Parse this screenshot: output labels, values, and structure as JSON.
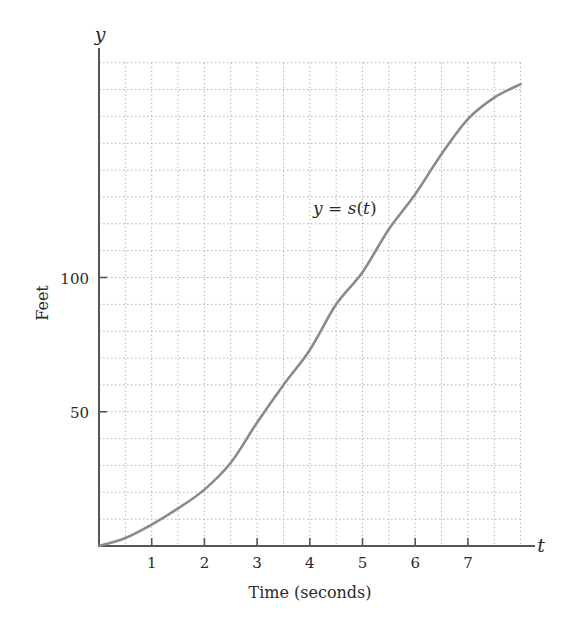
{
  "chart_data": {
    "type": "line",
    "title": "",
    "xlabel": "Time (seconds)",
    "ylabel": "Feet",
    "x_axis_var": "t",
    "y_axis_var": "y",
    "xlim": [
      0,
      8
    ],
    "ylim": [
      0,
      180
    ],
    "x_ticks": [
      1,
      2,
      3,
      4,
      5,
      6,
      7
    ],
    "x_tick_labels": [
      "1",
      "2",
      "3",
      "4",
      "5",
      "6",
      "7"
    ],
    "y_ticks": [
      50,
      100
    ],
    "y_tick_labels": [
      "50",
      "100"
    ],
    "grid": true,
    "grid_x_step": 0.5,
    "grid_y_step": 10,
    "grid_style": "dotted",
    "legend": null,
    "annotations": [
      {
        "text": "y = s(t)",
        "x": 5.1,
        "y": 125
      }
    ],
    "series": [
      {
        "name": "y = s(t)",
        "color": "#8a8a8a",
        "x": [
          0,
          0.5,
          1,
          1.5,
          2,
          2.5,
          3,
          3.5,
          4,
          4.5,
          5,
          5.5,
          6,
          6.5,
          7,
          7.5,
          8
        ],
        "values": [
          0,
          3,
          8,
          14,
          21,
          31,
          46,
          60,
          73,
          90,
          102,
          118,
          131,
          146,
          159,
          167,
          172
        ]
      }
    ]
  },
  "labels": {
    "y_var": "y",
    "t_var": "t",
    "ylabel": "Feet",
    "xlabel": "Time (seconds)",
    "annotation_lhs": "y",
    "annotation_eq": " = ",
    "annotation_fn": "s",
    "annotation_open": "(",
    "annotation_arg": "t",
    "annotation_close": ")"
  },
  "colors": {
    "axis": "#555555",
    "grid": "#b5b5b5",
    "curve": "#8a8a8a",
    "text": "#2a2a2a"
  }
}
